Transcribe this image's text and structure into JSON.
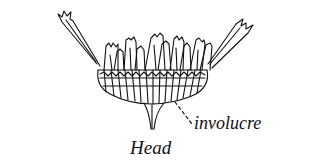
{
  "figure": {
    "labels": {
      "involucre": "involucre",
      "caption": "Head"
    },
    "colors": {
      "ink": "#111111",
      "background": "#ffffff"
    }
  }
}
